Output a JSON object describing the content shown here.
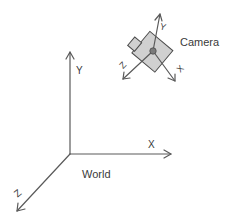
{
  "diagram": {
    "world": {
      "label": "World",
      "axes": {
        "x": "X",
        "y": "Y",
        "z": "Z"
      }
    },
    "camera": {
      "label": "Camera",
      "axes": {
        "x": "X",
        "y": "Y",
        "z": "Z"
      }
    },
    "colors": {
      "axis": "#5a5a5a",
      "text": "#3a3a3a",
      "camera_body_fill": "#d0d0d0",
      "camera_body_stroke": "#4a4a4a",
      "camera_center": "#7a7a7a"
    }
  }
}
